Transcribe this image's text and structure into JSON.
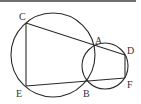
{
  "diagram": {
    "type": "geometry-two-intersecting-circles",
    "stroke_color": "#2a2a2a",
    "label_color": "#333333",
    "points": [
      {
        "id": "C",
        "label": "C"
      },
      {
        "id": "A",
        "label": "A"
      },
      {
        "id": "D",
        "label": "D"
      },
      {
        "id": "E",
        "label": "E"
      },
      {
        "id": "B",
        "label": "B"
      },
      {
        "id": "F",
        "label": "F"
      }
    ],
    "circles": [
      {
        "name": "large-circle",
        "passes_through": [
          "C",
          "A",
          "B",
          "E"
        ]
      },
      {
        "name": "small-circle",
        "passes_through": [
          "A",
          "D",
          "F",
          "B"
        ]
      }
    ],
    "segments": [
      [
        "C",
        "D"
      ],
      [
        "E",
        "F"
      ],
      [
        "C",
        "E"
      ],
      [
        "D",
        "F"
      ]
    ]
  }
}
